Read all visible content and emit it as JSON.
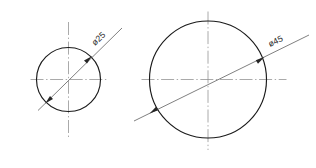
{
  "drawing": {
    "title": "Two concentric-centerline circle views with diameter dimensions",
    "background_color": "#ffffff",
    "outline_color": "#1a1a1a",
    "centerline_color": "#8d8d8d",
    "dimension_color": "#5f5f5f",
    "text_color": "#1f1f1f",
    "views": [
      {
        "id": "small-circle",
        "label": "ø25",
        "diameter_value": 25,
        "diameter_symbol": "ø",
        "center": {
          "x": 68.5,
          "y": 79.5
        },
        "radius": 32,
        "centerline_overhang": 13,
        "dimension": {
          "angle_deg": -27,
          "arrow_near": {
            "x": 46.0,
            "y": 102.5
          },
          "arrow_far": {
            "x": 91.0,
            "y": 57.0
          },
          "leader_start": {
            "x": 38.0,
            "y": 110.5
          },
          "leader_end": {
            "x": 122.0,
            "y": 28.0
          },
          "text_x": 95.0,
          "text_y": 46.0,
          "text_rotation_deg": -44
        }
      },
      {
        "id": "large-circle",
        "label": "ø45",
        "diameter_value": 45,
        "diameter_symbol": "ø",
        "center": {
          "x": 208.0,
          "y": 79.5
        },
        "radius": 58.5,
        "centerline_overhang": 19,
        "dimension": {
          "angle_deg": -24,
          "arrow_near": {
            "x": 150.5,
            "y": 113.0
          },
          "arrow_far": {
            "x": 263.5,
            "y": 57.5
          },
          "leader_start": {
            "x": 134.0,
            "y": 121.0
          },
          "leader_end": {
            "x": 309.0,
            "y": 35.0
          },
          "text_x": 270.0,
          "text_y": 47.0,
          "text_rotation_deg": -26
        }
      }
    ]
  }
}
